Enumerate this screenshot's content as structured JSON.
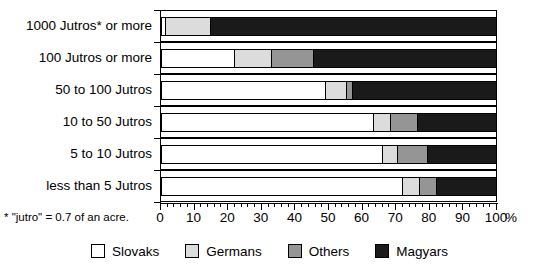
{
  "footnote": "* \"jutro\" = 0.7 of an acre.",
  "axis": {
    "percent_symbol": "%",
    "tick_labels": [
      "0",
      "10",
      "20",
      "30",
      "40",
      "50",
      "60",
      "70",
      "80",
      "90",
      "100"
    ]
  },
  "legend": {
    "items": [
      {
        "label": "Slovaks",
        "color": "#ffffff"
      },
      {
        "label": "Germans",
        "color": "#dcdcdc"
      },
      {
        "label": "Others",
        "color": "#959595"
      },
      {
        "label": "Magyars",
        "color": "#1a1a1a"
      }
    ]
  },
  "chart_data": {
    "type": "bar",
    "orientation": "horizontal",
    "stacked": true,
    "title": "",
    "xlabel": "%",
    "ylabel": "",
    "xlim": [
      0,
      100
    ],
    "grid": false,
    "legend_position": "bottom",
    "categories": [
      "1000 Jutros* or more",
      "100 Jutros or more",
      "50 to 100 Jutros",
      "10 to 50 Jutros",
      "5 to 10 Jutros",
      "less than 5 Jutros"
    ],
    "series": [
      {
        "name": "Slovaks",
        "color": "#ffffff",
        "values": [
          1.5,
          22,
          49,
          63.5,
          66,
          72
        ]
      },
      {
        "name": "Germans",
        "color": "#dcdcdc",
        "values": [
          13.5,
          11,
          6.5,
          5,
          4.5,
          5
        ]
      },
      {
        "name": "Others",
        "color": "#959595",
        "values": [
          0,
          12.5,
          1.5,
          8,
          9,
          5
        ]
      },
      {
        "name": "Magyars",
        "color": "#1a1a1a",
        "values": [
          85,
          54.5,
          43,
          23.5,
          20.5,
          18
        ]
      }
    ]
  }
}
